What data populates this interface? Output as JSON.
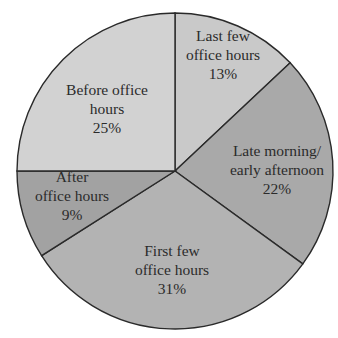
{
  "chart_data": {
    "type": "pie",
    "title": "",
    "start_angle_deg": 0,
    "direction": "clockwise",
    "slices": [
      {
        "label": "Last few office hours",
        "lines": [
          "Last few",
          "office hours",
          "13%"
        ],
        "value": 13,
        "color": "#c9c9c9",
        "label_pos": [
          223,
          41
        ]
      },
      {
        "label": "Late morning/ early afternoon",
        "lines": [
          "Late morning/",
          "early afternoon",
          "22%"
        ],
        "value": 22,
        "color": "#a9a9a9",
        "label_pos": [
          277,
          156
        ]
      },
      {
        "label": "First few office hours",
        "lines": [
          "First few",
          "office hours",
          "31%"
        ],
        "value": 31,
        "color": "#b3b3b3",
        "label_pos": [
          172,
          256
        ]
      },
      {
        "label": "After office hours",
        "lines": [
          "After",
          "office hours",
          "9%"
        ],
        "value": 9,
        "color": "#a2a2a2",
        "label_pos": [
          72,
          182
        ]
      },
      {
        "label": "Before office hours",
        "lines": [
          "Before office",
          "hours",
          "25%"
        ],
        "value": 25,
        "color": "#d2d2d2",
        "label_pos": [
          107,
          95
        ]
      }
    ],
    "categories": [
      "Last few office hours",
      "Late morning/ early afternoon",
      "First few office hours",
      "After office hours",
      "Before office hours"
    ],
    "values": [
      13,
      22,
      31,
      9,
      25
    ],
    "unit": "%",
    "legend": "none (labels inside slices)"
  },
  "geometry": {
    "cx": 175,
    "cy": 171,
    "r": 158
  }
}
